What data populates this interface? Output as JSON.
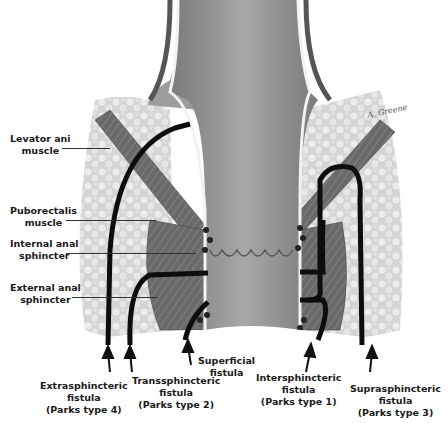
{
  "colors": {
    "background": "#ffffff",
    "fat": "#d9d9d9",
    "muscle": "#6e6e6e",
    "rectum": "#8c8c8c",
    "fistula_tract": "#0d0d0d",
    "label_text": "#1a1a1a"
  },
  "left_labels": [
    {
      "id": "levator-ani",
      "lines": [
        "Levator ani",
        "muscle"
      ]
    },
    {
      "id": "puborectalis",
      "lines": [
        "Puborectalis",
        "muscle"
      ]
    },
    {
      "id": "internal-anal-sphincter",
      "lines": [
        "Internal anal",
        "sphincter"
      ]
    },
    {
      "id": "external-anal-sphincter",
      "lines": [
        "External anal",
        "sphincter"
      ]
    }
  ],
  "bottom_labels": [
    {
      "id": "extrasphincteric",
      "lines": [
        "Extrasphincteric",
        "fistula",
        "(Parks type 4)"
      ]
    },
    {
      "id": "transsphincteric",
      "lines": [
        "Transsphincteric",
        "fistula",
        "(Parks type 2)"
      ]
    },
    {
      "id": "superficial",
      "lines": [
        "Superficial",
        "fistula"
      ]
    },
    {
      "id": "intersphincteric",
      "lines": [
        "Intersphincteric",
        "fistula",
        "(Parks type 1)"
      ]
    },
    {
      "id": "suprasphincteric",
      "lines": [
        "Suprasphincteric",
        "fistula",
        "(Parks type 3)"
      ]
    }
  ],
  "signature": "A. Greene"
}
